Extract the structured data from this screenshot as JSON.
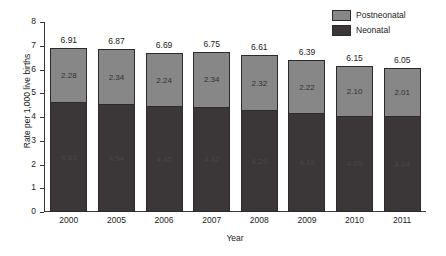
{
  "chart_data": {
    "type": "bar",
    "stacked": true,
    "title": "",
    "xlabel": "Year",
    "ylabel": "Rate per 1,000 live births",
    "categories": [
      "2000",
      "2005",
      "2006",
      "2007",
      "2008",
      "2009",
      "2010",
      "2011"
    ],
    "series": [
      {
        "name": "Neonatal",
        "color": "#3b3637",
        "values": [
          4.63,
          4.54,
          4.45,
          4.42,
          4.29,
          4.18,
          4.05,
          4.04
        ],
        "labels": [
          "4.63",
          "4.54",
          "4.45",
          "4.42",
          "4.29",
          "4.18",
          "4.05",
          "4.04"
        ]
      },
      {
        "name": "Postneonatal",
        "color": "#878787",
        "values": [
          2.28,
          2.34,
          2.24,
          2.34,
          2.32,
          2.22,
          2.1,
          2.01
        ],
        "labels": [
          "2.28",
          "2.34",
          "2.24",
          "2.34",
          "2.32",
          "2.22",
          "2.10",
          "2.01"
        ]
      }
    ],
    "totals": [
      6.91,
      6.87,
      6.69,
      6.75,
      6.61,
      6.39,
      6.15,
      6.05
    ],
    "total_labels": [
      "6.91",
      "6.87",
      "6.69",
      "6.75",
      "6.61",
      "6.39",
      "6.15",
      "6.05"
    ],
    "ylim": [
      0,
      8
    ],
    "yticks": [
      0,
      1,
      2,
      3,
      4,
      5,
      6,
      7,
      8
    ],
    "ytick_labels": [
      "0",
      "1",
      "2",
      "3",
      "4",
      "5",
      "6",
      "7",
      "8"
    ],
    "grid": false,
    "legend_position": "top-right"
  },
  "legend": {
    "items": [
      {
        "label": "Postneonatal",
        "color": "#878787"
      },
      {
        "label": "Neonatal",
        "color": "#3b3637"
      }
    ]
  },
  "axes": {
    "y_title": "Rate per 1,000 live births",
    "x_title": "Year"
  }
}
